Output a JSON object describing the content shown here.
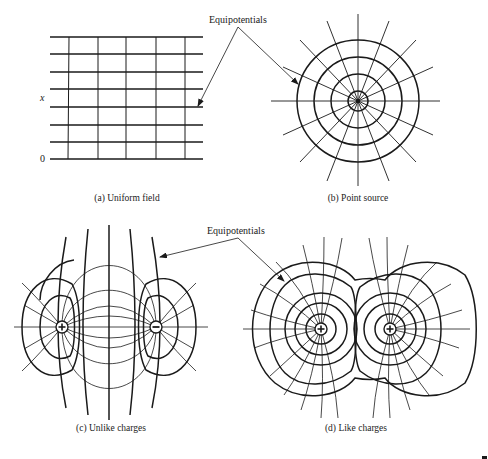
{
  "figure": {
    "annotations": {
      "equipotentials_top": "Equipotentials",
      "equipotentials_bottom": "Equipotentials"
    },
    "panels": [
      {
        "id": "a",
        "caption": "(a) Uniform field",
        "axis_labels": {
          "x": "x",
          "origin": "0"
        }
      },
      {
        "id": "b",
        "caption": "(b) Point source"
      },
      {
        "id": "c",
        "caption": "(c) Unlike charges",
        "charges": [
          "+",
          "−"
        ]
      },
      {
        "id": "d",
        "caption": "(d) Like charges",
        "charges": [
          "+",
          "+"
        ]
      }
    ],
    "colors": {
      "line": "#1a1a1a",
      "background": "#ffffff"
    }
  }
}
